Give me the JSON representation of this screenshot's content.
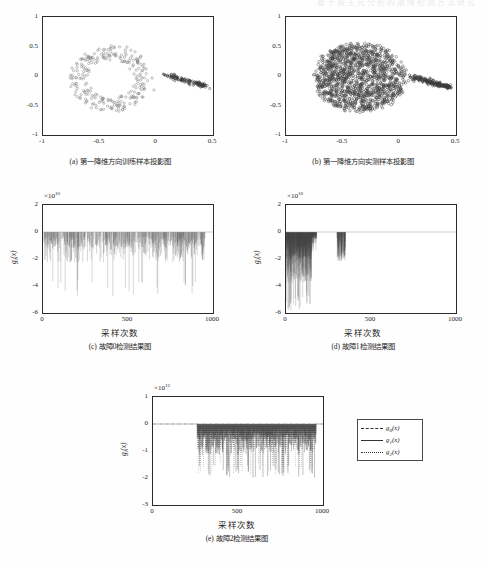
{
  "page": {
    "running_header": "基于核主元分析的故障检测方法研究"
  },
  "figures": [
    {
      "id": "a",
      "caption": "(a) 第一降维方向训练样本投影图",
      "type": "scatter",
      "xlabel": "",
      "ylabel": "",
      "xticks": [
        "-1",
        "-0.5",
        "0",
        "0.5"
      ],
      "xtickvals": [
        -1,
        -0.5,
        0,
        0.5
      ],
      "yticks": [
        "-1",
        "-0.5",
        "0",
        "0.5",
        "1"
      ],
      "ytickvals": [
        -1,
        -0.5,
        0,
        0.5,
        1
      ],
      "xlim": [
        -1,
        0.5
      ],
      "ylim": [
        -1,
        1
      ],
      "marker": "o",
      "marker_color": "#555555",
      "density": "sparse-ring",
      "description": "稀疏环状点云主体位于 x∈[-0.75,-0.05], y∈[-0.65,0.55]，右侧有一条自 x≈0.05 向 x≈0.45 延伸的致密尾部，y 从 0.05 降至 -0.18"
    },
    {
      "id": "b",
      "caption": "(b) 第一降维方向实测样本投影图",
      "type": "scatter",
      "xlabel": "",
      "ylabel": "",
      "xticks": [
        "-1",
        "-0.5",
        "0",
        "0.5"
      ],
      "xtickvals": [
        -1,
        -0.5,
        0,
        0.5
      ],
      "yticks": [
        "-1",
        "-0.5",
        "0",
        "0.5",
        "1"
      ],
      "ytickvals": [
        -1,
        -0.5,
        0,
        0.5,
        1
      ],
      "xlim": [
        -1,
        0.5
      ],
      "ylim": [
        -1,
        1
      ],
      "marker": "o",
      "marker_color": "#3a3a3a",
      "density": "dense-blob",
      "description": "致密团状点云主体位于 x∈[-0.78,0.08], y∈[-0.68,0.60]，右侧有一条自 x≈0.08 向 x≈0.45 延伸的致密尾部，y 从 0.0 降至 -0.20"
    }
  ],
  "charts": [
    {
      "id": "c",
      "caption": "(c) 故障0检测结果图",
      "type": "line",
      "xlabel": "采样次数",
      "ylabel": "g",
      "ylabel_sub": "i",
      "ylabel_suffix": "(x)",
      "exponent_mantissa": "×10",
      "exponent_power": "10",
      "xticks": [
        "0",
        "500",
        "1000"
      ],
      "xtickvals": [
        0,
        500,
        1000
      ],
      "yticks": [
        "2",
        "0",
        "-2",
        "-4",
        "-6"
      ],
      "ytickvals": [
        2,
        0,
        -2,
        -4,
        -6
      ],
      "xlim": [
        0,
        1000
      ],
      "ylim": [
        -6,
        2
      ],
      "series_note": "全程密集向下尖峰，主体在 0 至 -2×10^10，多处深谷达 -4×10^10 ~ -4.8×10^10"
    },
    {
      "id": "d",
      "caption": "(d) 故障1检测结果图",
      "type": "line",
      "xlabel": "采样次数",
      "ylabel": "g",
      "ylabel_sub": "i",
      "ylabel_suffix": "(x)",
      "exponent_mantissa": "×10",
      "exponent_power": "10",
      "xticks": [
        "0",
        "500",
        "1000"
      ],
      "xtickvals": [
        0,
        500,
        1000
      ],
      "yticks": [
        "2",
        "0",
        "-2",
        "-4",
        "-6"
      ],
      "ytickvals": [
        2,
        0,
        -2,
        -4,
        -6
      ],
      "xlim": [
        0,
        1000
      ],
      "ylim": [
        -6,
        2
      ],
      "series_note": "尖峰集中于 0~180 采样区间，深度达 -5.8×10^10；另在 300~350 处有一小簇，其余接近 0"
    },
    {
      "id": "e",
      "caption": "(e) 故障2检测结果图",
      "type": "line",
      "xlabel": "采样次数",
      "ylabel": "g",
      "ylabel_sub": "i",
      "ylabel_suffix": "(x)",
      "exponent_mantissa": "×10",
      "exponent_power": "12",
      "xticks": [
        "0",
        "500",
        "1000"
      ],
      "xtickvals": [
        0,
        500,
        1000
      ],
      "yticks": [
        "1",
        "0",
        "-1",
        "-2",
        "-3"
      ],
      "ytickvals": [
        1,
        0,
        -1,
        -2,
        -3
      ],
      "xlim": [
        0,
        1000
      ],
      "ylim": [
        -3,
        1
      ],
      "series_note": "0~260 接近 0，自 260 起出现密集向下尖峰，主体 0 ~ -1×10^12，最深约 -2×10^12"
    }
  ],
  "legend": {
    "position": "right-of-chart-e",
    "entries": [
      {
        "label": "g",
        "sub": "0",
        "suffix": "(x)",
        "style": "dash-dot",
        "color": "#333333"
      },
      {
        "label": "g",
        "sub": "1",
        "suffix": "(x)",
        "style": "solid",
        "color": "#333333"
      },
      {
        "label": "g",
        "sub": "2",
        "suffix": "(x)",
        "style": "dotted",
        "color": "#333333"
      }
    ]
  },
  "chart_data": [
    {
      "type": "scatter",
      "id": "a",
      "title": "(a) 第一降维方向训练样本投影图",
      "xlabel": "",
      "ylabel": "",
      "xlim": [
        -1,
        0.5
      ],
      "ylim": [
        -1,
        1
      ],
      "xticks": [
        -1,
        -0.5,
        0,
        0.5
      ],
      "yticks": [
        -1,
        -0.5,
        0,
        0.5,
        1
      ],
      "grid": false,
      "legend": "none",
      "clusters": [
        {
          "name": "training-ring",
          "n": 260,
          "cx": -0.4,
          "cy": -0.04,
          "rx": 0.34,
          "ry": 0.58,
          "shape": "ring"
        },
        {
          "name": "training-tail",
          "n": 120,
          "x0": 0.05,
          "y0": 0.04,
          "x1": 0.45,
          "y1": -0.18,
          "shape": "tail"
        }
      ]
    },
    {
      "type": "scatter",
      "id": "b",
      "title": "(b) 第一降维方向实测样本投影图",
      "xlabel": "",
      "ylabel": "",
      "xlim": [
        -1,
        0.5
      ],
      "ylim": [
        -1,
        1
      ],
      "xticks": [
        -1,
        -0.5,
        0,
        0.5
      ],
      "yticks": [
        -1,
        -0.5,
        0,
        0.5,
        1
      ],
      "grid": false,
      "legend": "none",
      "clusters": [
        {
          "name": "measured-blob",
          "n": 1400,
          "cx": -0.35,
          "cy": -0.03,
          "rx": 0.4,
          "ry": 0.62,
          "shape": "blob"
        },
        {
          "name": "measured-tail",
          "n": 200,
          "x0": 0.08,
          "y0": 0.0,
          "x1": 0.46,
          "y1": -0.2,
          "shape": "tail"
        }
      ]
    },
    {
      "type": "line",
      "id": "c",
      "title": "(c) 故障0检测结果图",
      "xlabel": "采样次数",
      "ylabel": "g_i(x)",
      "yscale_exponent": 10,
      "xlim": [
        0,
        1000
      ],
      "ylim": [
        -6,
        2
      ],
      "xticks": [
        0,
        500,
        1000
      ],
      "yticks": [
        -6,
        -4,
        -2,
        0,
        2
      ],
      "grid": false,
      "legend": "none",
      "series": [
        {
          "name": "g_i(x)",
          "style": "dotted-spikes",
          "baseline": 0,
          "spike_mean": -1.2,
          "spike_min": -4.8,
          "x_range": [
            0,
            960
          ],
          "density": "uniform"
        }
      ]
    },
    {
      "type": "line",
      "id": "d",
      "title": "(d) 故障1检测结果图",
      "xlabel": "采样次数",
      "ylabel": "g_i(x)",
      "yscale_exponent": 10,
      "xlim": [
        0,
        1000
      ],
      "ylim": [
        -6,
        2
      ],
      "xticks": [
        0,
        500,
        1000
      ],
      "yticks": [
        -6,
        -4,
        -2,
        0,
        2
      ],
      "grid": false,
      "legend": "none",
      "series": [
        {
          "name": "g_i(x)",
          "style": "dotted-spikes",
          "baseline": 0,
          "spike_mean": -2.0,
          "spike_min": -5.8,
          "x_range": [
            0,
            180
          ],
          "density": "front-loaded",
          "secondary_burst": {
            "x_range": [
              300,
              350
            ],
            "spike_min": -2.2
          }
        }
      ]
    },
    {
      "type": "line",
      "id": "e",
      "title": "(e) 故障2检测结果图",
      "xlabel": "采样次数",
      "ylabel": "g_i(x)",
      "yscale_exponent": 12,
      "xlim": [
        0,
        1000
      ],
      "ylim": [
        -3,
        1
      ],
      "xticks": [
        0,
        500,
        1000
      ],
      "yticks": [
        -3,
        -2,
        -1,
        0,
        1
      ],
      "grid": false,
      "legend": "right",
      "series": [
        {
          "name": "g_0(x)",
          "style": "dash-dot",
          "baseline": 0,
          "spike_min": -0.2
        },
        {
          "name": "g_1(x)",
          "style": "solid",
          "baseline": 0,
          "spike_mean": -0.6,
          "spike_min": -2.0,
          "x_range": [
            260,
            960
          ]
        },
        {
          "name": "g_2(x)",
          "style": "dotted",
          "baseline": 0,
          "spike_mean": -0.5,
          "spike_min": -1.9,
          "x_range": [
            260,
            960
          ]
        }
      ]
    }
  ]
}
